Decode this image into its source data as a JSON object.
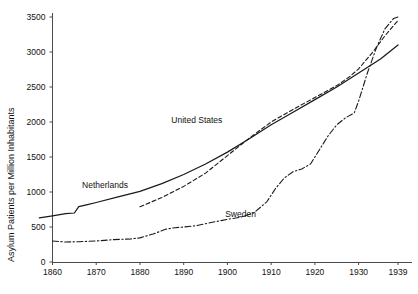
{
  "chart_data": {
    "type": "line",
    "title": "",
    "subtitle": "",
    "xlabel": "",
    "ylabel": "Asylum Patients per Million Inhabitants",
    "xlim": [
      1855,
      1939
    ],
    "ylim": [
      0,
      3500
    ],
    "grid": false,
    "legend_position": "inline-annotations",
    "x_ticks": [
      1860,
      1870,
      1880,
      1890,
      1900,
      1910,
      1920,
      1930,
      1939
    ],
    "x_tick_labels": [
      "1860",
      "1870",
      "1880",
      "1890",
      "1900",
      "1910",
      "1920",
      "1930",
      "1939"
    ],
    "y_ticks": [
      0,
      500,
      1000,
      1500,
      2000,
      2500,
      3000,
      3500
    ],
    "y_tick_labels": [
      "0",
      "500",
      "1000",
      "1500",
      "2000",
      "2500",
      "3000",
      "3500"
    ],
    "series": [
      {
        "name": "Netherlands",
        "style": "solid",
        "color": "#1a1a1a",
        "label_x": 1872,
        "label_y": 1060,
        "points": [
          [
            1857,
            630
          ],
          [
            1860,
            660
          ],
          [
            1863,
            690
          ],
          [
            1865,
            700
          ],
          [
            1866,
            790
          ],
          [
            1868,
            820
          ],
          [
            1870,
            850
          ],
          [
            1875,
            930
          ],
          [
            1880,
            1010
          ],
          [
            1885,
            1120
          ],
          [
            1890,
            1250
          ],
          [
            1895,
            1400
          ],
          [
            1900,
            1570
          ],
          [
            1905,
            1760
          ],
          [
            1910,
            1960
          ],
          [
            1915,
            2140
          ],
          [
            1920,
            2320
          ],
          [
            1925,
            2500
          ],
          [
            1930,
            2700
          ],
          [
            1935,
            2900
          ],
          [
            1939,
            3100
          ]
        ]
      },
      {
        "name": "United States",
        "style": "dashed",
        "color": "#1a1a1a",
        "label_x": 1893,
        "label_y": 1990,
        "points": [
          [
            1880,
            790
          ],
          [
            1885,
            920
          ],
          [
            1890,
            1080
          ],
          [
            1895,
            1270
          ],
          [
            1900,
            1520
          ],
          [
            1905,
            1770
          ],
          [
            1910,
            2000
          ],
          [
            1915,
            2180
          ],
          [
            1920,
            2350
          ],
          [
            1925,
            2520
          ],
          [
            1928,
            2650
          ],
          [
            1930,
            2760
          ],
          [
            1933,
            2980
          ],
          [
            1936,
            3230
          ],
          [
            1939,
            3450
          ]
        ]
      },
      {
        "name": "Sweden",
        "style": "dashdot",
        "color": "#1a1a1a",
        "label_x": 1903,
        "label_y": 640,
        "points": [
          [
            1860,
            300
          ],
          [
            1863,
            285
          ],
          [
            1866,
            290
          ],
          [
            1870,
            300
          ],
          [
            1874,
            320
          ],
          [
            1878,
            330
          ],
          [
            1880,
            345
          ],
          [
            1883,
            400
          ],
          [
            1886,
            470
          ],
          [
            1888,
            490
          ],
          [
            1890,
            500
          ],
          [
            1893,
            520
          ],
          [
            1896,
            560
          ],
          [
            1900,
            610
          ],
          [
            1903,
            640
          ],
          [
            1906,
            700
          ],
          [
            1909,
            860
          ],
          [
            1911,
            1050
          ],
          [
            1913,
            1200
          ],
          [
            1915,
            1290
          ],
          [
            1917,
            1330
          ],
          [
            1919,
            1400
          ],
          [
            1921,
            1600
          ],
          [
            1923,
            1800
          ],
          [
            1925,
            1960
          ],
          [
            1927,
            2060
          ],
          [
            1929,
            2130
          ],
          [
            1930,
            2300
          ],
          [
            1932,
            2700
          ],
          [
            1934,
            3050
          ],
          [
            1936,
            3330
          ],
          [
            1938,
            3480
          ],
          [
            1939,
            3500
          ]
        ]
      }
    ]
  }
}
